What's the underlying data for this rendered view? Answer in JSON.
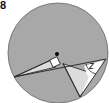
{
  "figure": {
    "number_label": "8",
    "angle_label": "z",
    "colors": {
      "circle_fill": "#a8a8a8",
      "light_region": "#dcdcdc",
      "wedge": "#ffffff",
      "stroke": "#222222"
    }
  }
}
